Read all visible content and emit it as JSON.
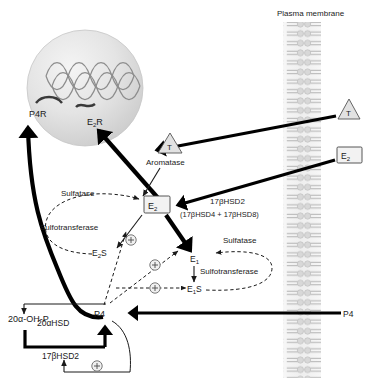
{
  "figure": {
    "type": "biochemical-pathway-diagram",
    "title_label": "Plasma membrane"
  },
  "membrane": {
    "label": "Plasma membrane"
  },
  "nucleus": {
    "receptors": [
      {
        "id": "p4r",
        "label": "P4R",
        "name": "progesterone-receptor"
      },
      {
        "id": "e2r",
        "label": "E",
        "sub": "2",
        "suffix": "R",
        "full": "E2R",
        "name": "estrogen-receptor"
      }
    ]
  },
  "extracellular": {
    "inputs": [
      {
        "id": "t-out",
        "label": "T",
        "shape": "triangle",
        "name": "testosterone-extracellular"
      },
      {
        "id": "e2-out",
        "label": "E",
        "sub": "2",
        "shape": "box",
        "name": "estradiol-extracellular"
      },
      {
        "id": "p4-out",
        "label": "P4",
        "shape": "plain",
        "name": "progesterone-extracellular"
      }
    ]
  },
  "enzymes": {
    "aromatase": "Aromatase",
    "aromatase_symbol": "T",
    "hsd17b2_main": "17βHSD2",
    "hsd17b2_detail": "(17βHSD4 + 17βHSD8)",
    "sulfatase_left": "Sulfatase",
    "sulfotransferase_left": "Sulfotransferase",
    "sulfatase_right": "Sulfatase",
    "sulfotransferase_right": "Sulfotransferase",
    "hsd20a": "20αHSD",
    "hsd17b2_bottom": "17βHSD2"
  },
  "metabolites": {
    "e2": {
      "label": "E",
      "sub": "2",
      "full": "E2",
      "name": "estradiol"
    },
    "e2s": {
      "label": "E",
      "sub": "2",
      "suffix": "S",
      "full": "E2S",
      "name": "estradiol-sulfate"
    },
    "e1": {
      "label": "E",
      "sub": "1",
      "full": "E1",
      "name": "estrone"
    },
    "e1s": {
      "label": "E",
      "sub": "1",
      "suffix": "S",
      "full": "E1S",
      "name": "estrone-sulfate"
    },
    "p4": {
      "label": "P4",
      "name": "progesterone"
    },
    "ohp": {
      "label": "20α-OH-P",
      "name": "20-alpha-hydroxyprogesterone"
    }
  },
  "modulators": {
    "plus_symbol": "+",
    "count": 4,
    "meaning": "stimulatory"
  },
  "colors": {
    "background": "#ffffff",
    "ink": "#1a1a1a",
    "node_fill": "#f2f2f2",
    "triangle_fill": "#e2e2e2",
    "membrane_gray": "#cfcfcf",
    "nucleus_gray": "#dedede"
  }
}
